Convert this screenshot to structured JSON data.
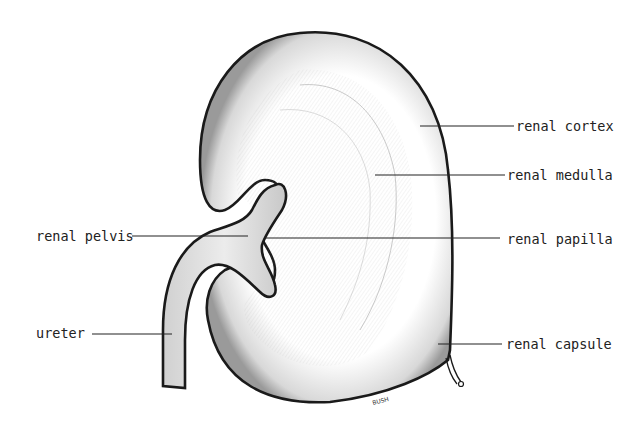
{
  "diagram": {
    "labels": {
      "renal_cortex": "renal cortex",
      "renal_medulla": "renal medulla",
      "renal_pelvis": "renal pelvis",
      "renal_papilla": "renal papilla",
      "ureter": "ureter",
      "renal_capsule": "renal capsule"
    },
    "signature": "BUSH",
    "colors": {
      "outline": "#1a1a1a",
      "shading": "#8a8a8a",
      "pelvis_fill": "#e6e6e6",
      "background": "#ffffff"
    }
  }
}
